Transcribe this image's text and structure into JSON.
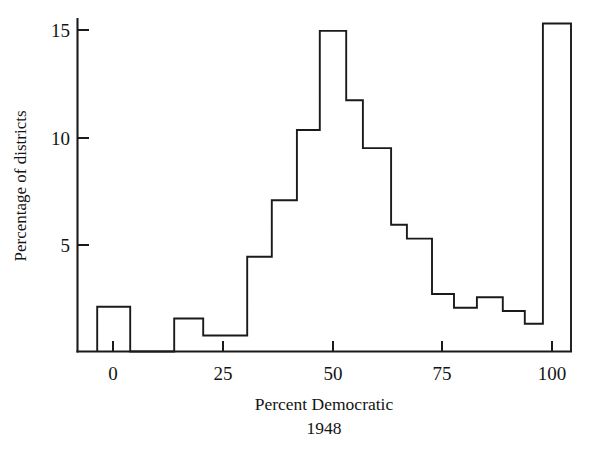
{
  "chart_data": {
    "type": "bar",
    "title": "",
    "xlabel": "Percent Democratic",
    "xlabel_line2": "1948",
    "ylabel": "Percentage of districts",
    "xlim": [
      -8,
      106
    ],
    "ylim": [
      0,
      15.8
    ],
    "xticks": [
      0,
      25,
      50,
      75,
      100
    ],
    "xticklabels": [
      "0",
      "25",
      "50",
      "75",
      "100"
    ],
    "yticks": [
      5,
      10,
      15
    ],
    "yticklabels": [
      "5",
      "10",
      "15"
    ],
    "grid": false,
    "legend": null,
    "bin_edges": [
      -3.6,
      3.9,
      13.9,
      20.5,
      30.5,
      36.1,
      41.8,
      47.0,
      53.0,
      56.8,
      63.2,
      66.8,
      72.5,
      77.5,
      82.7,
      88.6,
      93.6,
      97.7,
      104.1
    ],
    "bars": [
      {
        "x0": -3.6,
        "x1": 3.9,
        "value": 2.1
      },
      {
        "x0": 3.9,
        "x1": 13.9,
        "value": 0.0
      },
      {
        "x0": 13.9,
        "x1": 20.5,
        "value": 1.55
      },
      {
        "x0": 20.5,
        "x1": 30.5,
        "value": 0.75
      },
      {
        "x0": 30.5,
        "x1": 36.1,
        "value": 4.45
      },
      {
        "x0": 36.1,
        "x1": 41.8,
        "value": 7.1
      },
      {
        "x0": 41.8,
        "x1": 47.0,
        "value": 10.4
      },
      {
        "x0": 47.0,
        "x1": 53.0,
        "value": 15.05
      },
      {
        "x0": 53.0,
        "x1": 56.8,
        "value": 11.8
      },
      {
        "x0": 56.8,
        "x1": 63.2,
        "value": 9.55
      },
      {
        "x0": 63.2,
        "x1": 66.8,
        "value": 5.95
      },
      {
        "x0": 66.8,
        "x1": 72.5,
        "value": 5.3
      },
      {
        "x0": 72.5,
        "x1": 77.5,
        "value": 2.7
      },
      {
        "x0": 77.5,
        "x1": 82.7,
        "value": 2.05
      },
      {
        "x0": 82.7,
        "x1": 88.6,
        "value": 2.55
      },
      {
        "x0": 88.6,
        "x1": 93.6,
        "value": 1.9
      },
      {
        "x0": 93.6,
        "x1": 97.7,
        "value": 1.3
      },
      {
        "x0": 97.7,
        "x1": 104.1,
        "value": 15.4
      }
    ],
    "colors": {
      "line": "#1a1a1a",
      "background": "#ffffff",
      "text": "#141414"
    }
  }
}
